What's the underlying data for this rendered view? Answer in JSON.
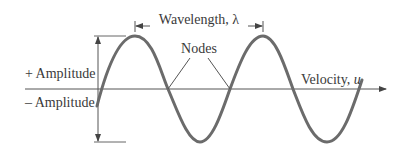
{
  "diagram": {
    "labels": {
      "wavelength": "Wavelength, λ",
      "nodes": "Nodes",
      "plus_amplitude": "+ Amplitude",
      "minus_amplitude": "– Amplitude",
      "velocity": "Velocity, ",
      "velocity_symbol": "u"
    },
    "colors": {
      "wave": "#6b6b6b",
      "lines": "#5a5a5a",
      "text": "#3a3a3a"
    }
  }
}
